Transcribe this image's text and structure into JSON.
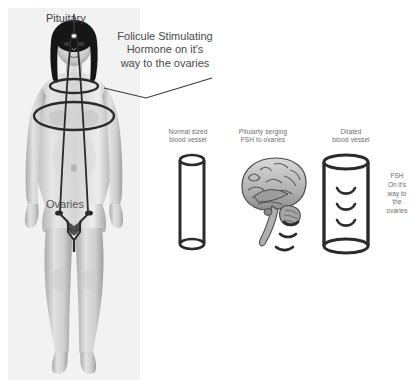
{
  "diagram": {
    "title_text": "Folicule Stimulating\nHormone on it's\nway to the ovaries",
    "figure": {
      "pituitary_label": "Pituitary",
      "ovaries_label": "Ovaries",
      "pointer_icon": "leader-line"
    },
    "panels": [
      {
        "id": "normal-vessel",
        "label": "Normal sized\nblood vessel",
        "icon": "cylinder-icon"
      },
      {
        "id": "brain-fsh",
        "label": "Pituiarty serging\nFSH to ovaries",
        "icon": "brain-sagittal-icon"
      },
      {
        "id": "dilated-vessel",
        "label": "Dilated\nblood vessel",
        "icon": "cylinder-wide-icon"
      }
    ],
    "side_note": "FSH\nOn it's\nway to\nthe\novaries",
    "colors": {
      "background": "#ffffff",
      "panel_background": "#f2f2f2",
      "text": "#4a4a4a",
      "small_text": "#6b6b6b",
      "outline": "#2b2b2b",
      "hair": "#161616",
      "skin_light": "#e3e3e3",
      "skin_mid": "#c4c4c4",
      "skin_dark": "#9a9a9a"
    }
  }
}
